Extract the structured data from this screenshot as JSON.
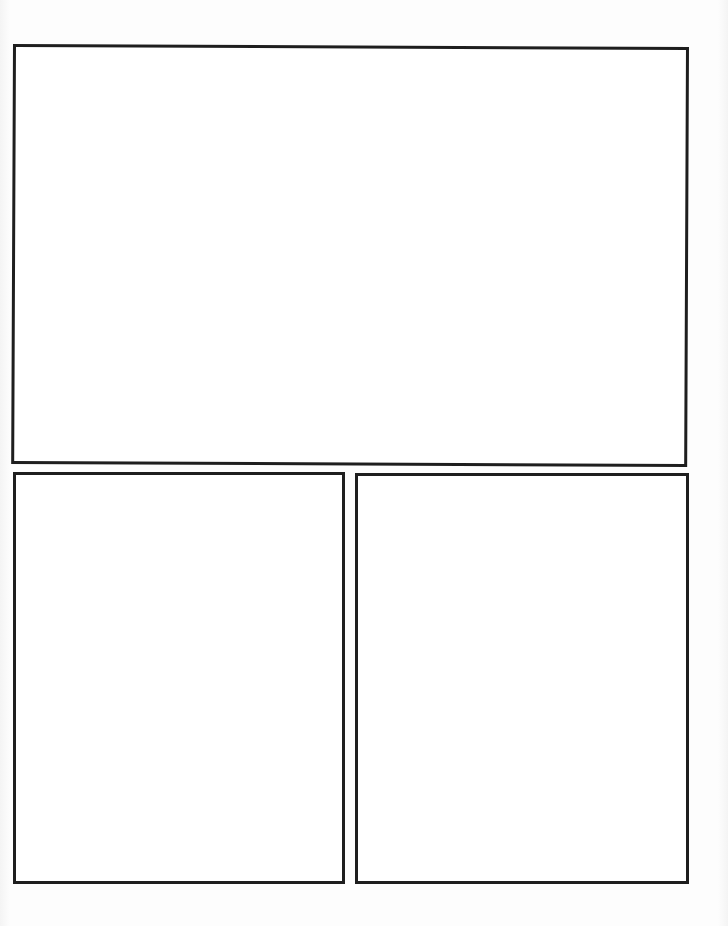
{
  "document": {
    "type": "comic-page-template",
    "panel_count": 3,
    "border_color": "#1e1e1e",
    "background_color": "#ffffff"
  },
  "panels": [
    {
      "id": "top",
      "position": "top-full-width",
      "content": ""
    },
    {
      "id": "bottom-left",
      "position": "bottom-left",
      "content": ""
    },
    {
      "id": "bottom-right",
      "position": "bottom-right",
      "content": ""
    }
  ]
}
